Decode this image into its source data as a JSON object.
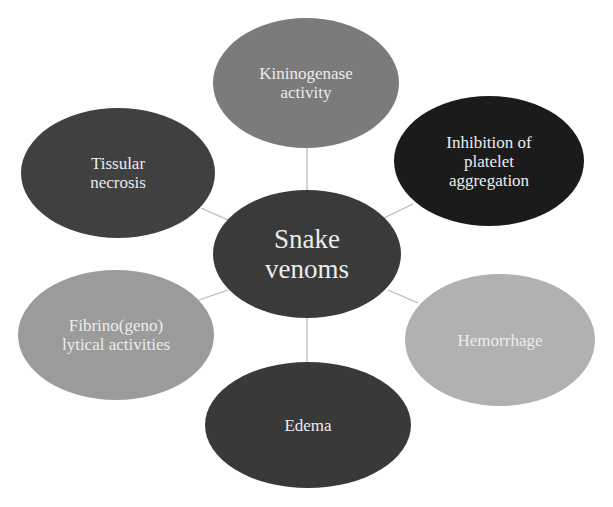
{
  "diagram": {
    "title": "Snake venoms",
    "center": {
      "label_line1": "Snake",
      "label_line2": "venoms",
      "color": "#3a3a3a",
      "cx": 307,
      "cy": 254,
      "rx": 94,
      "ry": 64
    },
    "nodes": [
      {
        "id": "kininogenase",
        "line1": "Kininogenase",
        "line2": "activity",
        "line3": "",
        "color": "#7b7b7b",
        "cx": 306,
        "cy": 83,
        "rx": 93,
        "ry": 65
      },
      {
        "id": "platelet",
        "line1": "Inhibition of",
        "line2": "platelet",
        "line3": "aggregation",
        "color": "#1b1b1b",
        "cx": 489,
        "cy": 161,
        "rx": 95,
        "ry": 65
      },
      {
        "id": "hemorrhage",
        "line1": "Hemorrhage",
        "line2": "",
        "line3": "",
        "color": "#b1b1b1",
        "cx": 500,
        "cy": 340,
        "rx": 95,
        "ry": 66
      },
      {
        "id": "edema",
        "line1": "Edema",
        "line2": "",
        "line3": "",
        "color": "#393939",
        "cx": 308,
        "cy": 425,
        "rx": 103,
        "ry": 63
      },
      {
        "id": "fibrino",
        "line1": "Fibrino(geno)",
        "line2": "lytical activities",
        "line3": "",
        "color": "#9b9b9b",
        "cx": 116,
        "cy": 335,
        "rx": 98,
        "ry": 65
      },
      {
        "id": "tissular",
        "line1": "Tissular",
        "line2": "necrosis",
        "line3": "",
        "color": "#404040",
        "cx": 118,
        "cy": 173,
        "rx": 97,
        "ry": 65
      }
    ],
    "connector_color": "#b8b8b8"
  }
}
